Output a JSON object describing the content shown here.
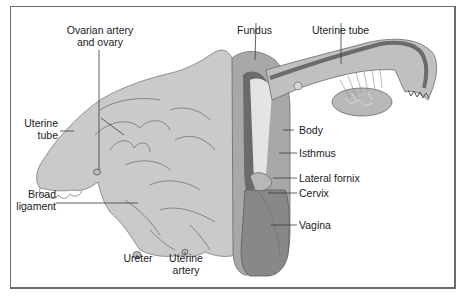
{
  "diagram": {
    "colors": {
      "border": "#6a6a6a",
      "ligament": "#c9c9c9",
      "ligament_dark": "#b5b5b5",
      "muscle": "#a9a9a9",
      "lumen": "#6b6b6b",
      "cavity_light": "#e6e6e6",
      "vagina": "#8a8a8a",
      "line": "#3a3a3a"
    },
    "labels": {
      "ovarian_artery_line1": "Ovarian artery",
      "ovarian_artery_line2": "and ovary",
      "fundus": "Fundus",
      "uterine_tube_right": "Uterine tube",
      "uterine_tube_left_line1": "Uterine",
      "uterine_tube_left_line2": "tube",
      "body": "Body",
      "isthmus": "Isthmus",
      "lateral_fornix": "Lateral fornix",
      "cervix": "Cervix",
      "broad_ligament_line1": "Broad",
      "broad_ligament_line2": "ligament",
      "vagina": "Vagina",
      "ureter": "Ureter",
      "uterine_artery_line1": "Uterine",
      "uterine_artery_line2": "artery"
    }
  }
}
